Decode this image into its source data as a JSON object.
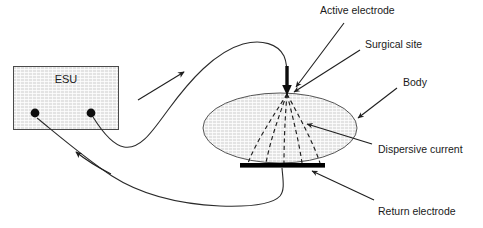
{
  "diagram": {
    "background_color": "#ffffff",
    "ink_color": "#1f1f1f",
    "hatch_fill_color": "#d9d9d9",
    "electrode_bar_color": "#000000"
  },
  "generator": {
    "label": "ESU",
    "terminal_left_name": "return-terminal",
    "terminal_right_name": "active-terminal"
  },
  "labels": {
    "active_electrode": "Active electrode",
    "surgical_site": "Surgical site",
    "body": "Body",
    "dispersive_current": "Dispersive current",
    "return_electrode": "Return electrode"
  },
  "elements": {
    "body_shape": "ellipse",
    "return_electrode_shape": "bar",
    "active_electrode_shape": "down-arrow",
    "dispersive_current_shape": "dashed-fan",
    "dispersive_current_line_count": 5
  },
  "flow": {
    "outbound_arrow_name": "current-direction-out",
    "return_arrow_name": "current-direction-back"
  }
}
